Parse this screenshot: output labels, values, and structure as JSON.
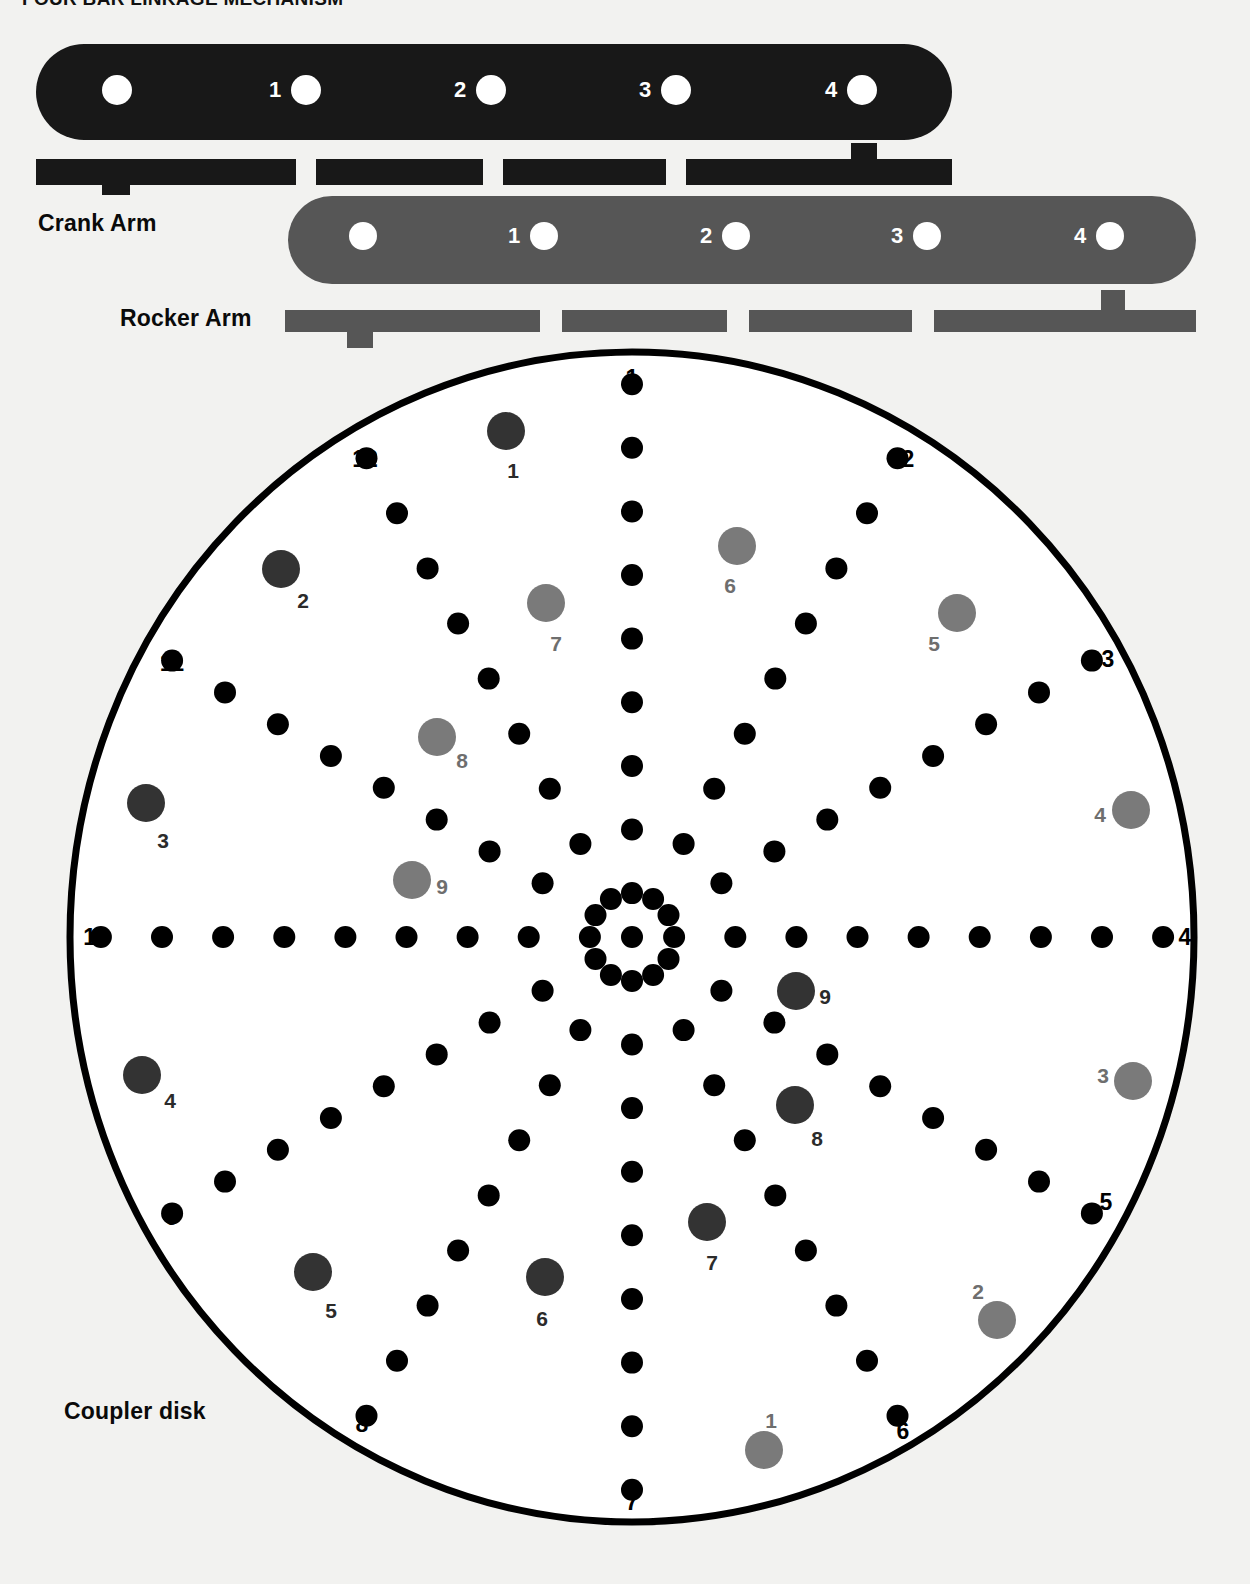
{
  "title": "FOUR BAR LINKAGE MECHANISM",
  "labels": {
    "crank_arm": "Crank Arm",
    "rocker_arm": "Rocker Arm",
    "coupler_disk": "Coupler disk"
  },
  "colors": {
    "background": "#f2f2f0",
    "crank_arm": "#181818",
    "rocker_arm": "#565656",
    "disk_outline": "#000000",
    "spoke_dot": "#000000",
    "dark_circle": "#333333",
    "gray_circle": "#7a7a7a",
    "hole": "#ffffff",
    "text": "#000000"
  },
  "crank_arm": {
    "name": "Crank Arm",
    "hole_labels": [
      "",
      "1",
      "2",
      "3",
      "4"
    ],
    "bar_segments": 4
  },
  "rocker_arm": {
    "name": "Rocker Arm",
    "hole_labels": [
      "",
      "1",
      "2",
      "3",
      "4"
    ],
    "bar_segments": 4
  },
  "coupler_disk": {
    "name": "Coupler disk",
    "center": [
      632,
      937
    ],
    "radius_x": 562,
    "radius_y": 585,
    "spoke_count": 12,
    "dots_per_spoke": 9,
    "rim_labels": [
      "1",
      "2",
      "3",
      "4",
      "5",
      "6",
      "7",
      "8",
      "9",
      "10",
      "11",
      "12"
    ],
    "dark_circle_labels": [
      "1",
      "2",
      "3",
      "4",
      "5",
      "6",
      "7",
      "8",
      "9"
    ],
    "gray_circle_labels": [
      "1",
      "2",
      "3",
      "4",
      "5",
      "6",
      "7",
      "8",
      "9"
    ]
  },
  "chart_data": {
    "type": "scatter",
    "xlabel": "",
    "ylabel": "",
    "series": [
      {
        "name": "spoke-dots",
        "color": "#000000",
        "radius": 11,
        "description": "12 radial spokes of 9 black dots each, every 30 degrees",
        "points": [
          {
            "spoke": 1,
            "angle": -90,
            "indices": [
              1,
              2,
              3,
              4,
              5,
              6,
              7,
              8,
              9
            ]
          },
          {
            "spoke": 2,
            "angle": -60,
            "indices": [
              1,
              2,
              3,
              4,
              5,
              6,
              7,
              8,
              9
            ]
          },
          {
            "spoke": 3,
            "angle": -30,
            "indices": [
              1,
              2,
              3,
              4,
              5,
              6,
              7,
              8,
              9
            ]
          },
          {
            "spoke": 4,
            "angle": 0,
            "indices": [
              1,
              2,
              3,
              4,
              5,
              6,
              7,
              8,
              9
            ]
          },
          {
            "spoke": 5,
            "angle": 30,
            "indices": [
              1,
              2,
              3,
              4,
              5,
              6,
              7,
              8,
              9
            ]
          },
          {
            "spoke": 6,
            "angle": 60,
            "indices": [
              1,
              2,
              3,
              4,
              5,
              6,
              7,
              8,
              9
            ]
          },
          {
            "spoke": 7,
            "angle": 90,
            "indices": [
              1,
              2,
              3,
              4,
              5,
              6,
              7,
              8,
              9
            ]
          },
          {
            "spoke": 8,
            "angle": 120,
            "indices": [
              1,
              2,
              3,
              4,
              5,
              6,
              7,
              8,
              9
            ]
          },
          {
            "spoke": 9,
            "angle": 150,
            "indices": [
              1,
              2,
              3,
              4,
              5,
              6,
              7,
              8,
              9
            ]
          },
          {
            "spoke": 10,
            "angle": 180,
            "indices": [
              1,
              2,
              3,
              4,
              5,
              6,
              7,
              8,
              9
            ]
          },
          {
            "spoke": 11,
            "angle": 210,
            "indices": [
              1,
              2,
              3,
              4,
              5,
              6,
              7,
              8,
              9
            ]
          },
          {
            "spoke": 12,
            "angle": 240,
            "indices": [
              1,
              2,
              3,
              4,
              5,
              6,
              7,
              8,
              9
            ]
          }
        ]
      },
      {
        "name": "dark-circles",
        "color": "#333333",
        "radius": 19,
        "points": [
          {
            "label": "1",
            "x": 506,
            "y": 431,
            "lx": 513,
            "ly": 470
          },
          {
            "label": "2",
            "x": 281,
            "y": 569,
            "lx": 303,
            "ly": 600
          },
          {
            "label": "3",
            "x": 146,
            "y": 803,
            "lx": 163,
            "ly": 840
          },
          {
            "label": "4",
            "x": 142,
            "y": 1075,
            "lx": 170,
            "ly": 1100
          },
          {
            "label": "5",
            "x": 313,
            "y": 1272,
            "lx": 331,
            "ly": 1310
          },
          {
            "label": "6",
            "x": 545,
            "y": 1277,
            "lx": 542,
            "ly": 1318
          },
          {
            "label": "7",
            "x": 707,
            "y": 1222,
            "lx": 712,
            "ly": 1262
          },
          {
            "label": "8",
            "x": 795,
            "y": 1105,
            "lx": 817,
            "ly": 1138
          },
          {
            "label": "9",
            "x": 796,
            "y": 991,
            "lx": 825,
            "ly": 996
          }
        ]
      },
      {
        "name": "gray-circles",
        "color": "#7a7a7a",
        "radius": 19,
        "points": [
          {
            "label": "1",
            "x": 764,
            "y": 1450,
            "lx": 771,
            "ly": 1420
          },
          {
            "label": "2",
            "x": 997,
            "y": 1320,
            "lx": 978,
            "ly": 1291
          },
          {
            "label": "3",
            "x": 1133,
            "y": 1081,
            "lx": 1103,
            "ly": 1075
          },
          {
            "label": "4",
            "x": 1131,
            "y": 810,
            "lx": 1100,
            "ly": 814
          },
          {
            "label": "5",
            "x": 957,
            "y": 613,
            "lx": 934,
            "ly": 643
          },
          {
            "label": "6",
            "x": 737,
            "y": 546,
            "lx": 730,
            "ly": 585
          },
          {
            "label": "7",
            "x": 546,
            "y": 603,
            "lx": 556,
            "ly": 643
          },
          {
            "label": "8",
            "x": 437,
            "y": 737,
            "lx": 462,
            "ly": 760
          },
          {
            "label": "9",
            "x": 412,
            "y": 880,
            "lx": 442,
            "ly": 886
          }
        ]
      }
    ],
    "rim_labels": [
      {
        "label": "1",
        "x": 632,
        "y": 378
      },
      {
        "label": "2",
        "x": 908,
        "y": 459
      },
      {
        "label": "3",
        "x": 1108,
        "y": 659
      },
      {
        "label": "4",
        "x": 1185,
        "y": 937
      },
      {
        "label": "5",
        "x": 1106,
        "y": 1202
      },
      {
        "label": "6",
        "x": 903,
        "y": 1431
      },
      {
        "label": "7",
        "x": 632,
        "y": 1502
      },
      {
        "label": "8",
        "x": 362,
        "y": 1424
      },
      {
        "label": "9",
        "x": 172,
        "y": 1217
      },
      {
        "label": "10",
        "x": 96,
        "y": 937
      },
      {
        "label": "11",
        "x": 172,
        "y": 663
      },
      {
        "label": "12",
        "x": 365,
        "y": 459
      }
    ]
  }
}
